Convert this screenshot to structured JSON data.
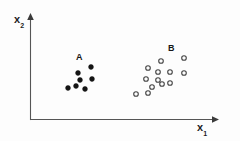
{
  "figure": {
    "background_color": "#fdfdfd",
    "ink_color": "#4a4a4a",
    "marker_color": "#141414"
  },
  "axes": {
    "x_axis": {
      "label": "x",
      "subscript": "1",
      "name": "x1",
      "orientation": "horizontal",
      "arrow": true,
      "start_px": [
        31,
        119
      ],
      "end_px": [
        215,
        119
      ]
    },
    "y_axis": {
      "label": "x",
      "subscript": "2",
      "name": "x2",
      "orientation": "vertical",
      "arrow": true,
      "start_px": [
        31,
        119
      ],
      "end_px": [
        31,
        15
      ]
    }
  },
  "annotations": [
    {
      "text": "A",
      "x": 76,
      "y": 53,
      "refers_to": "cluster-a"
    },
    {
      "text": "B",
      "x": 168,
      "y": 44,
      "refers_to": "cluster-b"
    }
  ],
  "chart_data": {
    "type": "scatter",
    "title": "",
    "xlabel": "x1",
    "ylabel": "x2",
    "grid": false,
    "legend": "none",
    "axis_units": "pixels (unlabeled axes, no tick marks)",
    "series": [
      {
        "name": "A",
        "marker": "filled-circle",
        "color": "#141414",
        "radius_px": 2.4,
        "count": 7,
        "points": [
          [
            91,
            67
          ],
          [
            78,
            73
          ],
          [
            80,
            80
          ],
          [
            92,
            79
          ],
          [
            68,
            88
          ],
          [
            76,
            86
          ],
          [
            85,
            89
          ]
        ]
      },
      {
        "name": "B",
        "marker": "open-circle",
        "color": "#444444",
        "radius_px": 2.3,
        "count": 13,
        "points": [
          [
            184,
            58
          ],
          [
            161,
            61
          ],
          [
            148,
            68
          ],
          [
            158,
            72
          ],
          [
            170,
            72
          ],
          [
            184,
            73
          ],
          [
            146,
            79
          ],
          [
            158,
            80
          ],
          [
            162,
            84
          ],
          [
            170,
            83
          ],
          [
            136,
            94
          ],
          [
            148,
            93
          ],
          [
            152,
            87
          ]
        ]
      }
    ]
  }
}
